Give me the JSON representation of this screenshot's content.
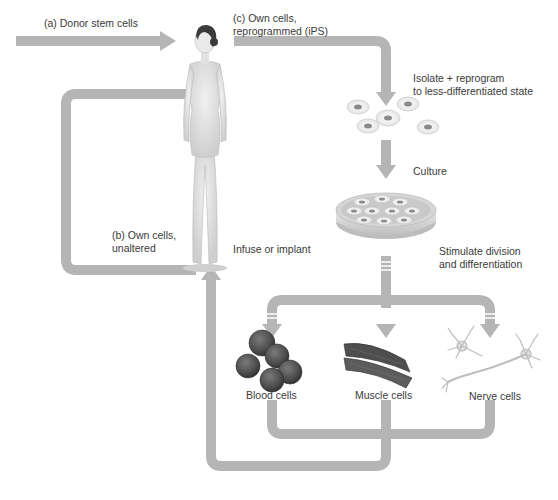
{
  "colors": {
    "arrow": "#b5b5b5",
    "arrow_stripe": "#ffffff",
    "text": "#3a3a3a",
    "skin": "#e6e6e6",
    "skin_shade": "#c9c9c9",
    "hair": "#3b3b3b",
    "blood_cell": "#5a5a5a",
    "muscle": "#555555",
    "nerve": "#e0e0e0",
    "dish": "#d9d9d9"
  },
  "labels": {
    "donor": "(a) Donor stem cells",
    "ips": [
      "(c) Own cells,",
      "reprogrammed (iPS)"
    ],
    "isolate": [
      "Isolate + reprogram",
      "to less-differentiated state"
    ],
    "culture": "Culture",
    "stimulate": [
      "Stimulate division",
      "and differentiation"
    ],
    "unaltered": [
      "(b) Own cells,",
      "unaltered"
    ],
    "infuse": "Infuse or implant",
    "blood": "Blood cells",
    "muscle": "Muscle cells",
    "nerve": "Nerve cells"
  },
  "icons": {
    "human": "human-figure-icon",
    "suspended_cells": "stem-cells-icon",
    "dish": "petri-dish-icon",
    "blood": "blood-cells-icon",
    "muscle": "muscle-cells-icon",
    "nerve": "nerve-cells-icon"
  }
}
